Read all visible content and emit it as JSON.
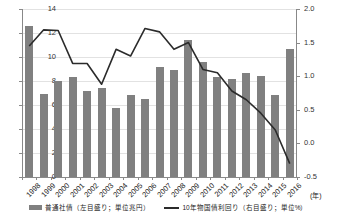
{
  "chart_data": {
    "type": "bar",
    "title": "",
    "subtitle": "",
    "xlabel": "(年)",
    "ylabel": "",
    "categories": [
      "1998",
      "1999",
      "2000",
      "2001",
      "2002",
      "2003",
      "2004",
      "2005",
      "2006",
      "2007",
      "2008",
      "2009",
      "2010",
      "2011",
      "2012",
      "2013",
      "2014",
      "2015",
      "2016"
    ],
    "grid": true,
    "legend_position": "bottom",
    "left_axis": {
      "label": "",
      "unit": "兆円",
      "ylim": [
        0,
        14
      ],
      "ticks": [
        0,
        2,
        4,
        6,
        8,
        10,
        12,
        14
      ],
      "tick_labels": [
        "0",
        "2",
        "4",
        "6",
        "8",
        "10",
        "12",
        "14"
      ]
    },
    "right_axis": {
      "label": "",
      "unit": "%",
      "ylim": [
        -0.5,
        2.0
      ],
      "ticks": [
        -0.5,
        0.0,
        0.5,
        1.0,
        1.5,
        2.0
      ],
      "tick_labels": [
        "-0.5",
        "0.0",
        "0.5",
        "1.0",
        "1.5",
        "2.0"
      ]
    },
    "series": [
      {
        "name": "普通社債（左目盛り；単位兆円）",
        "type": "bar",
        "axis": "left",
        "color": "#808080",
        "values": [
          12.6,
          6.9,
          8.0,
          8.3,
          7.15,
          7.4,
          5.75,
          6.8,
          6.5,
          9.2,
          8.9,
          11.4,
          9.6,
          8.3,
          8.2,
          8.65,
          8.45,
          6.85,
          10.65
        ]
      },
      {
        "name": "10年物国債利回り（右目盛り；単位%）",
        "type": "line",
        "axis": "right",
        "color": "#2b2b2b",
        "values": [
          1.45,
          1.69,
          1.68,
          1.19,
          1.19,
          0.88,
          1.4,
          1.3,
          1.71,
          1.66,
          1.4,
          1.5,
          1.1,
          1.05,
          0.78,
          0.65,
          0.45,
          0.2,
          -0.3
        ]
      }
    ]
  },
  "legend": {
    "items": [
      {
        "label": "普通社債（左目盛り；単位兆円）",
        "marker": "bar-swatch"
      },
      {
        "label": "10年物国債利回り（右目盛り；単位%）",
        "marker": "line-swatch"
      }
    ]
  },
  "axis_unit_note": "(年)"
}
